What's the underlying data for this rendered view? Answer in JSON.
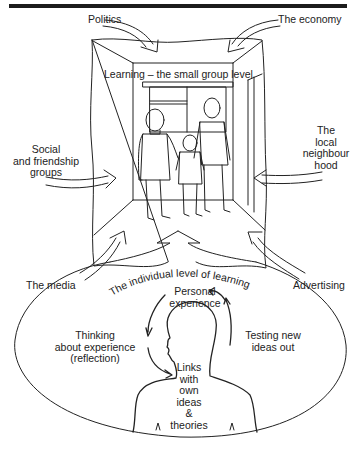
{
  "diagram": {
    "title_bar_color": "#1c1c1c",
    "line_color": "#222222",
    "background": "#ffffff",
    "outer_influences": [
      {
        "id": "politics",
        "label": "Politics"
      },
      {
        "id": "economy",
        "label": "The economy"
      },
      {
        "id": "social",
        "label_lines": [
          "Social",
          "and friendship",
          "groups"
        ]
      },
      {
        "id": "neighbourhood",
        "label_lines": [
          "The",
          "local",
          "neighbour",
          "hood"
        ]
      },
      {
        "id": "media",
        "label": "The media"
      },
      {
        "id": "advertising",
        "label": "Advertising"
      }
    ],
    "small_group": {
      "label": "Learning – the small group level",
      "figures": [
        "woman",
        "child",
        "man"
      ]
    },
    "individual": {
      "arc_label": "The individual level of learning",
      "cycle": [
        {
          "id": "personal",
          "label_lines": [
            "Personal",
            "experience"
          ]
        },
        {
          "id": "testing",
          "label_lines": [
            "Testing new",
            "ideas out"
          ]
        },
        {
          "id": "thinking",
          "label_lines": [
            "Thinking",
            "about experience",
            "(reflection)"
          ]
        },
        {
          "id": "links",
          "label_lines": [
            "Links",
            "with",
            "own",
            "ideas",
            "&",
            "theories"
          ]
        }
      ]
    }
  }
}
